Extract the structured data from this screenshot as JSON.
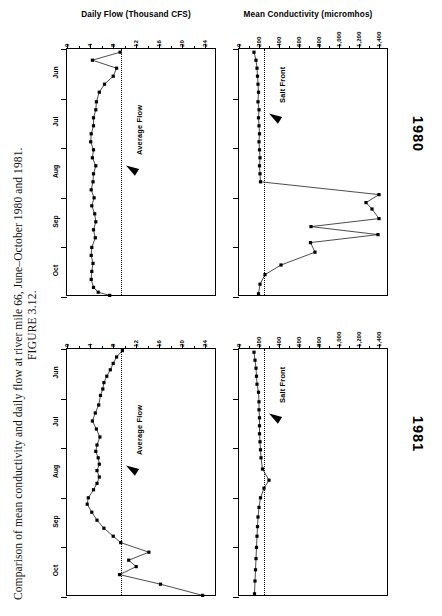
{
  "figure": {
    "number": "FIGURE 3.12.",
    "caption": "Comparison of mean conductivity and daily flow at river mile 66, June–October 1980 and 1981."
  },
  "panels": {
    "flow_title": "Daily Flow (Thousand CFS)",
    "cond_title": "Mean Conductivity (micromhos)",
    "flow_annotation": "Average Flow",
    "cond_annotation": "Salt Front"
  },
  "years": [
    {
      "label": "1980"
    },
    {
      "label": "1981"
    }
  ],
  "axes": {
    "flow_ticks": [
      "0",
      "4",
      "8",
      "12",
      "16",
      "20",
      "24"
    ],
    "cond_ticks": [
      "0",
      "200",
      "400",
      "600",
      "800",
      "1,000",
      "1,200",
      "1,400"
    ],
    "months": [
      "Jun",
      "Jul",
      "Aug",
      "Sep",
      "Oct"
    ]
  },
  "chart_data": {
    "type": "line",
    "title": "Comparison of mean conductivity and daily flow at river mile 66, June–October 1980 and 1981",
    "xlabel": "",
    "ylabel": "Month",
    "grid": false,
    "legend": "none",
    "panels": [
      {
        "year": "1980",
        "variable": "Daily Flow (Thousand CFS)",
        "xlabel": "Daily Flow (Thousand CFS)",
        "xlim": [
          0,
          26
        ],
        "xticks": [
          0,
          4,
          8,
          12,
          16,
          20,
          24
        ],
        "ylabel": "Month",
        "ylim": [
          "Jun 1",
          "Nov 1"
        ],
        "yticks": [
          "Jun",
          "Jul",
          "Aug",
          "Sep",
          "Oct"
        ],
        "reference_line": {
          "label": "Average Flow",
          "value": 9.4
        },
        "x": [
          9.2,
          4.4,
          8.6,
          8.0,
          6.5,
          5.6,
          5.1,
          5.0,
          4.6,
          4.6,
          4.2,
          4.1,
          4.6,
          4.4,
          5.0,
          4.6,
          4.5,
          4.2,
          4.7,
          4.3,
          4.8,
          5.0,
          4.6,
          4.9,
          4.3,
          4.2,
          4.5,
          4.3,
          4.2,
          4.6,
          5.4,
          7.4
        ],
        "y": [
          "Jun 3",
          "Jun 8",
          "Jun 13",
          "Jun 18",
          "Jun 23",
          "Jun 28",
          "Jul 3",
          "Jul 8",
          "Jul 13",
          "Jul 18",
          "Jul 23",
          "Jul 28",
          "Aug 2",
          "Aug 7",
          "Aug 12",
          "Aug 17",
          "Aug 22",
          "Aug 27",
          "Sep 1",
          "Sep 6",
          "Sep 11",
          "Sep 16",
          "Sep 21",
          "Sep 26",
          "Oct 1",
          "Oct 6",
          "Oct 11",
          "Oct 16",
          "Oct 21",
          "Oct 26",
          "Oct 29",
          "Oct 31"
        ]
      },
      {
        "year": "1980",
        "variable": "Mean Conductivity (micromhos)",
        "xlabel": "Mean Conductivity (micromhos)",
        "xlim": [
          0,
          1500
        ],
        "xticks": [
          0,
          200,
          400,
          600,
          800,
          1000,
          1200,
          1400
        ],
        "ylabel": "Month",
        "ylim": [
          "Jun 1",
          "Nov 1"
        ],
        "yticks": [
          "Jun",
          "Jul",
          "Aug",
          "Sep",
          "Oct"
        ],
        "reference_line": {
          "label": "Salt Front",
          "value": 250
        },
        "x": [
          150,
          170,
          180,
          185,
          190,
          195,
          190,
          200,
          195,
          200,
          205,
          200,
          205,
          210,
          205,
          210,
          215,
          1400,
          1270,
          1330,
          1400,
          720,
          1390,
          715,
          760,
          420,
          260,
          210,
          195
        ],
        "y": [
          "Jun 3",
          "Jun 8",
          "Jun 13",
          "Jun 18",
          "Jun 23",
          "Jun 28",
          "Jul 3",
          "Jul 8",
          "Jul 13",
          "Jul 18",
          "Jul 23",
          "Jul 28",
          "Aug 2",
          "Aug 7",
          "Aug 12",
          "Aug 17",
          "Aug 22",
          "Aug 30",
          "Sep 4",
          "Sep 8",
          "Sep 14",
          "Sep 19",
          "Sep 24",
          "Sep 29",
          "Oct 4",
          "Oct 12",
          "Oct 18",
          "Oct 24",
          "Oct 30"
        ]
      },
      {
        "year": "1981",
        "variable": "Daily Flow (Thousand CFS)",
        "xlabel": "Daily Flow (Thousand CFS)",
        "xlim": [
          0,
          26
        ],
        "xticks": [
          0,
          4,
          8,
          12,
          16,
          20,
          24
        ],
        "ylabel": "Month",
        "ylim": [
          "Jun 1",
          "Nov 1"
        ],
        "yticks": [
          "Jun",
          "Jul",
          "Aug",
          "Sep",
          "Oct"
        ],
        "reference_line": {
          "label": "Average Flow",
          "value": 9.4
        },
        "x": [
          9.6,
          8.6,
          8.0,
          7.5,
          6.9,
          6.4,
          6.2,
          5.8,
          5.5,
          4.9,
          4.4,
          5.1,
          5.7,
          5.2,
          5.0,
          5.4,
          5.6,
          5.2,
          5.6,
          5.2,
          4.6,
          3.7,
          3.5,
          4.3,
          5.2,
          6.4,
          8.0,
          9.3,
          14.2,
          10.7,
          12.0,
          9.1,
          16.2,
          23.5
        ],
        "y": [
          "Jun 2",
          "Jun 6",
          "Jun 10",
          "Jun 14",
          "Jun 18",
          "Jun 22",
          "Jun 26",
          "Jun 30",
          "Jul 5",
          "Jul 10",
          "Jul 15",
          "Jul 20",
          "Jul 25",
          "Jul 30",
          "Aug 3",
          "Aug 7",
          "Aug 11",
          "Aug 15",
          "Aug 19",
          "Aug 23",
          "Aug 27",
          "Sep 1",
          "Sep 5",
          "Sep 10",
          "Sep 15",
          "Sep 20",
          "Sep 25",
          "Sep 29",
          "Oct 4",
          "Oct 9",
          "Oct 13",
          "Oct 18",
          "Oct 24",
          "Oct 31"
        ]
      },
      {
        "year": "1981",
        "variable": "Mean Conductivity (micromhos)",
        "xlabel": "Mean Conductivity (micromhos)",
        "xlim": [
          0,
          1500
        ],
        "xticks": [
          0,
          200,
          400,
          600,
          800,
          1000,
          1200,
          1400
        ],
        "ylabel": "Month",
        "ylim": [
          "Jun 1",
          "Nov 1"
        ],
        "yticks": [
          "Jun",
          "Jul",
          "Aug",
          "Sep",
          "Oct"
        ],
        "reference_line": {
          "label": "Salt Front",
          "value": 250
        },
        "x": [
          150,
          160,
          170,
          175,
          180,
          195,
          200,
          200,
          205,
          205,
          205,
          210,
          215,
          220,
          235,
          300,
          250,
          215,
          200,
          190,
          185,
          180,
          175,
          170,
          165,
          160,
          155
        ],
        "y": [
          "Jun 3",
          "Jun 8",
          "Jun 13",
          "Jun 18",
          "Jun 23",
          "Jun 28",
          "Jul 3",
          "Jul 8",
          "Jul 13",
          "Jul 18",
          "Jul 23",
          "Jul 28",
          "Aug 2",
          "Aug 7",
          "Aug 14",
          "Aug 21",
          "Aug 26",
          "Sep 1",
          "Sep 7",
          "Sep 13",
          "Sep 19",
          "Sep 25",
          "Oct 1",
          "Oct 8",
          "Oct 15",
          "Oct 22",
          "Oct 30"
        ]
      }
    ]
  }
}
